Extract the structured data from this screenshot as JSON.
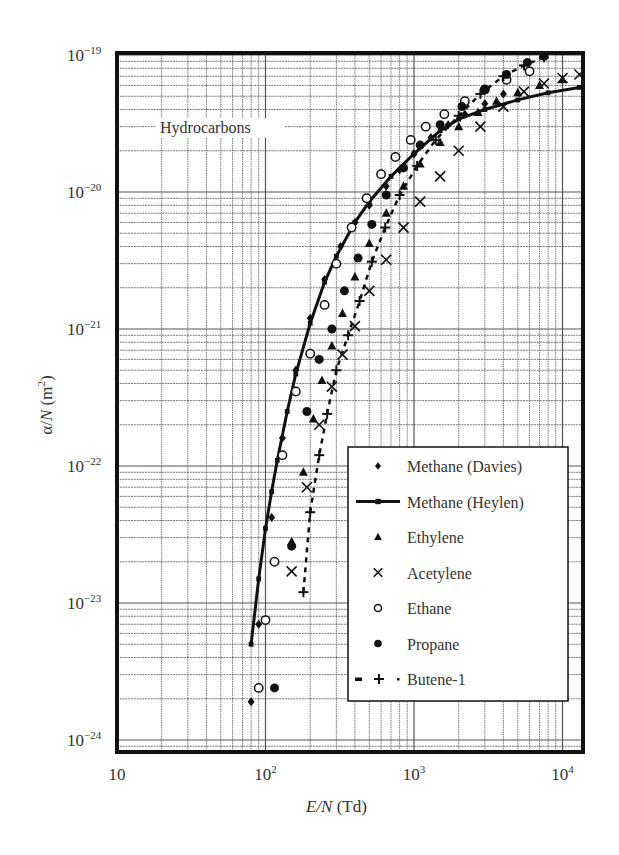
{
  "chart_data": {
    "type": "scatter",
    "title": "",
    "annotation": "Hydrocarbons",
    "xlabel": "E/N (Td)",
    "ylabel": "α/N (m²)",
    "xscale": "log",
    "yscale": "log",
    "xlim": [
      10,
      14000
    ],
    "ylim": [
      7e-25,
      1.1e-19
    ],
    "x_ticks": [
      {
        "value": 10,
        "label": "10",
        "exp": ""
      },
      {
        "value": 100,
        "label": "10",
        "exp": "2"
      },
      {
        "value": 1000,
        "label": "10",
        "exp": "3"
      },
      {
        "value": 10000,
        "label": "10",
        "exp": "4"
      }
    ],
    "y_ticks": [
      {
        "value": 1e-19,
        "label": "10",
        "exp": "−19"
      },
      {
        "value": 1e-20,
        "label": "10",
        "exp": "−20"
      },
      {
        "value": 1e-21,
        "label": "10",
        "exp": "−21"
      },
      {
        "value": 1e-22,
        "label": "10",
        "exp": "−22"
      },
      {
        "value": 1e-23,
        "label": "10",
        "exp": "−23"
      },
      {
        "value": 1e-24,
        "label": "10",
        "exp": "−24"
      }
    ],
    "grid": true,
    "legend_position": "lower right",
    "legend": [
      {
        "name": "Methane (Davies)",
        "marker": "diamond",
        "line": "none"
      },
      {
        "name": "Methane (Heylen)",
        "marker": "square",
        "line": "solid"
      },
      {
        "name": "Ethylene",
        "marker": "triangle",
        "line": "none"
      },
      {
        "name": "Acetylene",
        "marker": "x",
        "line": "none"
      },
      {
        "name": "Ethane",
        "marker": "open-circle",
        "line": "none"
      },
      {
        "name": "Propane",
        "marker": "filled-circle",
        "line": "none"
      },
      {
        "name": "Butene-1",
        "marker": "plus",
        "line": "dashed"
      }
    ],
    "series": [
      {
        "name": "Methane (Davies)",
        "x": [
          80,
          90,
          110,
          130,
          160,
          200,
          250,
          320,
          400,
          500,
          650,
          800,
          1000,
          1300,
          1700,
          2200,
          3000,
          4000
        ],
        "y": [
          1.9e-24,
          7e-24,
          4.2e-23,
          1.6e-22,
          5e-22,
          1.2e-21,
          2.3e-21,
          4e-21,
          6e-21,
          8e-21,
          1.1e-20,
          1.45e-20,
          1.9e-20,
          2.5e-20,
          3.1e-20,
          3.7e-20,
          4.4e-20,
          5.2e-20
        ]
      },
      {
        "name": "Methane (Heylen)",
        "x": [
          80,
          90,
          100,
          110,
          120,
          140,
          160,
          200,
          250,
          300,
          400,
          500,
          700,
          1000,
          1500,
          2000,
          3000,
          5000,
          8000,
          13000
        ],
        "y": [
          5e-24,
          1.5e-23,
          3.5e-23,
          6.5e-23,
          1.1e-22,
          2.5e-22,
          4.7e-22,
          1.1e-21,
          2.2e-21,
          3.4e-21,
          6e-21,
          8.5e-21,
          1.3e-20,
          1.9e-20,
          2.8e-20,
          3.4e-20,
          4e-20,
          4.7e-20,
          5.3e-20,
          5.8e-20
        ]
      },
      {
        "name": "Ethylene",
        "x": [
          150,
          180,
          210,
          240,
          280,
          330,
          400,
          500,
          650,
          850,
          1100,
          1500,
          2000,
          2700,
          3600,
          5000,
          7000,
          10000
        ],
        "y": [
          2.8e-23,
          9e-23,
          2.2e-22,
          4.2e-22,
          7.5e-22,
          1.3e-21,
          2.4e-21,
          4.2e-21,
          7e-21,
          1.1e-20,
          1.6e-20,
          2.3e-20,
          3e-20,
          3.8e-20,
          4.6e-20,
          5.3e-20,
          6e-20,
          6.6e-20
        ]
      },
      {
        "name": "Acetylene",
        "x": [
          150,
          190,
          230,
          280,
          330,
          400,
          500,
          650,
          850,
          1100,
          1500,
          2000,
          2800,
          4000,
          5500,
          7500,
          10000,
          13000
        ],
        "y": [
          1.7e-23,
          7e-23,
          2e-22,
          3.8e-22,
          6.5e-22,
          1.05e-21,
          1.9e-21,
          3.2e-21,
          5.5e-21,
          8.5e-21,
          1.3e-20,
          2e-20,
          3e-20,
          4.2e-20,
          5.4e-20,
          6.2e-20,
          6.8e-20,
          7.2e-20
        ]
      },
      {
        "name": "Ethane",
        "x": [
          90,
          100,
          115,
          130,
          160,
          200,
          250,
          300,
          380,
          480,
          600,
          750,
          950,
          1200,
          1600,
          2200,
          3000,
          4200,
          6000
        ],
        "y": [
          2.4e-24,
          7.5e-24,
          2e-23,
          1.2e-22,
          3.5e-22,
          6.6e-22,
          1.5e-21,
          3e-21,
          5.5e-21,
          9e-21,
          1.35e-20,
          1.8e-20,
          2.4e-20,
          3e-20,
          3.7e-20,
          4.6e-20,
          5.6e-20,
          6.6e-20,
          7.6e-20
        ]
      },
      {
        "name": "Propane",
        "x": [
          115,
          150,
          190,
          230,
          280,
          340,
          420,
          520,
          650,
          850,
          1100,
          1500,
          2100,
          3000,
          4200,
          5800,
          7500
        ],
        "y": [
          2.4e-24,
          2.6e-23,
          2.5e-22,
          6e-22,
          1e-21,
          1.9e-21,
          3.3e-21,
          5.8e-21,
          9.5e-21,
          1.5e-20,
          2.2e-20,
          3.1e-20,
          4.2e-20,
          5.6e-20,
          7.2e-20,
          8.8e-20,
          9.8e-20
        ]
      },
      {
        "name": "Butene-1",
        "x": [
          180,
          200,
          230,
          260,
          300,
          360,
          430,
          520,
          640,
          800,
          1050,
          1400,
          2000,
          2800,
          4000,
          5500,
          7500
        ],
        "y": [
          1.2e-23,
          4.6e-23,
          1.2e-22,
          2.4e-22,
          5e-22,
          9e-22,
          1.6e-21,
          3.1e-21,
          5.5e-21,
          9.5e-21,
          1.55e-20,
          2.4e-20,
          3.6e-20,
          5.2e-20,
          7e-20,
          8.4e-20,
          9.6e-20
        ]
      }
    ]
  },
  "plot": {
    "frame": {
      "left": 117,
      "right": 583,
      "top": 53,
      "bottom": 752
    },
    "x_px_per_decade": 148.5,
    "x_origin_px": 117,
    "y_ref_px": 55,
    "y_ref_exp": -19,
    "y_px_per_decade": 137
  },
  "colors": {
    "ink": "#111111",
    "grid": "#555555",
    "text": "#333333",
    "background": "#ffffff"
  }
}
